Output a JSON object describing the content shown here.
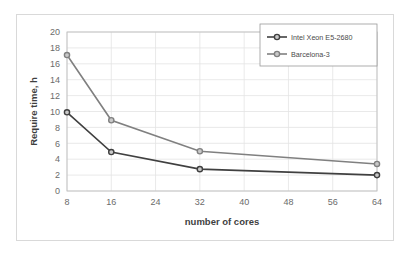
{
  "chart_data": {
    "type": "line",
    "title": "",
    "xlabel": "number of cores",
    "ylabel": "Require time, h",
    "x": [
      8,
      16,
      32,
      64
    ],
    "xticks": [
      8,
      16,
      24,
      32,
      40,
      48,
      56,
      64
    ],
    "yticks": [
      0,
      2,
      4,
      6,
      8,
      10,
      12,
      14,
      16,
      18,
      20
    ],
    "xlim": [
      8,
      64
    ],
    "ylim": [
      0,
      20
    ],
    "grid": true,
    "legend_position": "top-right",
    "series": [
      {
        "name": "Intel Xeon E5-2680",
        "color": "#404040",
        "values": [
          9.9,
          4.9,
          2.75,
          2.0
        ]
      },
      {
        "name": "Barcelona-3",
        "color": "#808080",
        "values": [
          17.1,
          8.9,
          5.0,
          3.4
        ]
      }
    ]
  },
  "axes": {
    "x_title": "number of cores",
    "y_title": "Require time, h",
    "x_tick_labels": [
      "8",
      "16",
      "24",
      "32",
      "40",
      "48",
      "56",
      "64"
    ],
    "y_tick_labels": [
      "0",
      "2",
      "4",
      "6",
      "8",
      "10",
      "12",
      "14",
      "16",
      "18",
      "20"
    ]
  },
  "legend": {
    "entries": [
      {
        "label": "Intel Xeon E5-2680"
      },
      {
        "label": "Barcelona-3"
      }
    ]
  }
}
